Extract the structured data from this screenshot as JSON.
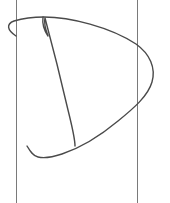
{
  "sketch": {
    "subject": "letter-D",
    "canvas": {
      "width": 170,
      "height": 203,
      "background": "#ffffff"
    },
    "guides": {
      "color": "#7a7a7a",
      "width": 1,
      "left_x": 16.5,
      "right_x": 137.5,
      "y_start": 0,
      "y_end": 203
    },
    "strokes": {
      "color": "#4a4a4a",
      "width": 1.4,
      "outer_bowl": {
        "path": "M 16 36 C 7 30, 6 24, 14 21 C 24 18, 36 17, 44 17 C 70 17, 110 27, 136 44 C 150 54, 156 68, 152 82 C 148 96, 134 108, 118 121 C 100 136, 80 148, 62 154 C 50 158, 42 158, 38 157 C 33 156, 30 151, 27 146"
      },
      "stem": {
        "path": "M 43 17 C 42 24, 44 30, 48 36 C 45 28, 44 22, 45 18 C 52 44, 62 84, 68 110 C 72 126, 75 138, 75 146"
      }
    }
  }
}
